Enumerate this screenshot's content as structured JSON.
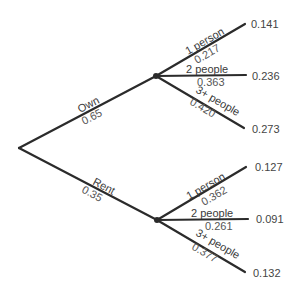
{
  "diagram": {
    "type": "probability-tree",
    "root": {
      "x": 19,
      "y": 148
    },
    "branches": [
      {
        "label": "Own",
        "probability": "0.65",
        "node": {
          "x": 156,
          "y": 76
        },
        "children": [
          {
            "label": "1 person",
            "probability": "0.217",
            "end": {
              "x": 245,
              "y": 24
            },
            "joint": "0.141"
          },
          {
            "label": "2 people",
            "probability": "0.363",
            "end": {
              "x": 246,
              "y": 75
            },
            "joint": "0.236"
          },
          {
            "label": "3+ people",
            "probability": "0.420",
            "end": {
              "x": 244,
              "y": 128
            },
            "joint": "0.273"
          }
        ]
      },
      {
        "label": "Rent",
        "probability": "0.35",
        "node": {
          "x": 157,
          "y": 220
        },
        "children": [
          {
            "label": "1 person",
            "probability": "0.362",
            "end": {
              "x": 246,
              "y": 167
            },
            "joint": "0.127"
          },
          {
            "label": "2 people",
            "probability": "0.261",
            "end": {
              "x": 248,
              "y": 219
            },
            "joint": "0.091"
          },
          {
            "label": "3+ people",
            "probability": "0.377",
            "end": {
              "x": 245,
              "y": 272
            },
            "joint": "0.132"
          }
        ]
      }
    ]
  }
}
